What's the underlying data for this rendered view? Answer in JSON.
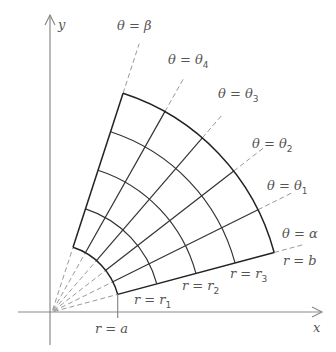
{
  "figure": {
    "axes": {
      "x_label": "x",
      "y_label": "y"
    },
    "origin_px": [
      52,
      312
    ],
    "radii": {
      "a": 68,
      "b": 230,
      "count": 5
    },
    "angles_deg": {
      "alpha": 15,
      "beta": 72,
      "count": 6
    },
    "ray_labels": [
      {
        "id": "alpha",
        "text": "θ = α",
        "x": 282,
        "y": 238
      },
      {
        "id": "theta1",
        "text": "θ = θ",
        "sub": "1",
        "x": 267,
        "y": 190
      },
      {
        "id": "theta2",
        "text": "θ = θ",
        "sub": "2",
        "x": 252,
        "y": 148
      },
      {
        "id": "theta3",
        "text": "θ = θ",
        "sub": "3",
        "x": 218,
        "y": 98
      },
      {
        "id": "theta4",
        "text": "θ = θ",
        "sub": "4",
        "x": 168,
        "y": 64
      },
      {
        "id": "beta",
        "text": "θ = β",
        "x": 117,
        "y": 30
      }
    ],
    "arc_labels": [
      {
        "id": "a",
        "text": "r = a",
        "x": 95,
        "y": 333
      },
      {
        "id": "r1",
        "text": "r = r",
        "sub": "1",
        "x": 134,
        "y": 304
      },
      {
        "id": "r2",
        "text": "r = r",
        "sub": "2",
        "x": 182,
        "y": 290
      },
      {
        "id": "r3",
        "text": "r = r",
        "sub": "3",
        "x": 230,
        "y": 278
      },
      {
        "id": "b",
        "text": "r = b",
        "x": 283,
        "y": 265
      }
    ],
    "colors": {
      "grid": "#333333",
      "axis": "#8a8a8a",
      "dashed": "#9a9a9a",
      "text": "#555555"
    }
  }
}
